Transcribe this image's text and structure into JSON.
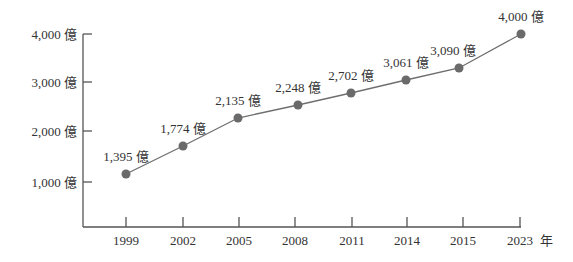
{
  "chart_data": {
    "type": "line",
    "title": "",
    "xlabel": "",
    "ylabel": "",
    "unit_suffix": "億",
    "x_unit_suffix": "年",
    "categories": [
      "1999",
      "2002",
      "2005",
      "2008",
      "2011",
      "2014",
      "2015",
      "2023"
    ],
    "values": [
      1395,
      1774,
      2135,
      2248,
      2702,
      3061,
      3090,
      4000
    ],
    "point_labels": [
      "1,395 億",
      "1,774 億",
      "2,135 億",
      "2,248 億",
      "2,702 億",
      "3,061 億",
      "3,090 億",
      "4,000 億"
    ],
    "y_ticks": [
      1000,
      2000,
      3000,
      4000
    ],
    "y_tick_labels": [
      "1,000 億",
      "2,000 億",
      "3,000 億",
      "4,000 億"
    ],
    "x_tick_labels": [
      "1999",
      "2002",
      "2005",
      "2008",
      "2011",
      "2014",
      "2015",
      "2023"
    ],
    "x_axis_unit_label": "年",
    "ylim": [
      0,
      4000
    ],
    "grid": false,
    "legend": null,
    "colors": {
      "line": "#6e6e6e",
      "marker": "#6a6a6a",
      "axis": "#555555",
      "text": "#333333"
    },
    "plot_positions": [
      {
        "x": 126,
        "y": 174
      },
      {
        "x": 183,
        "y": 146
      },
      {
        "x": 238,
        "y": 118
      },
      {
        "x": 298,
        "y": 105
      },
      {
        "x": 351,
        "y": 93
      },
      {
        "x": 406,
        "y": 80
      },
      {
        "x": 459,
        "y": 68
      },
      {
        "x": 521,
        "y": 34
      }
    ]
  }
}
